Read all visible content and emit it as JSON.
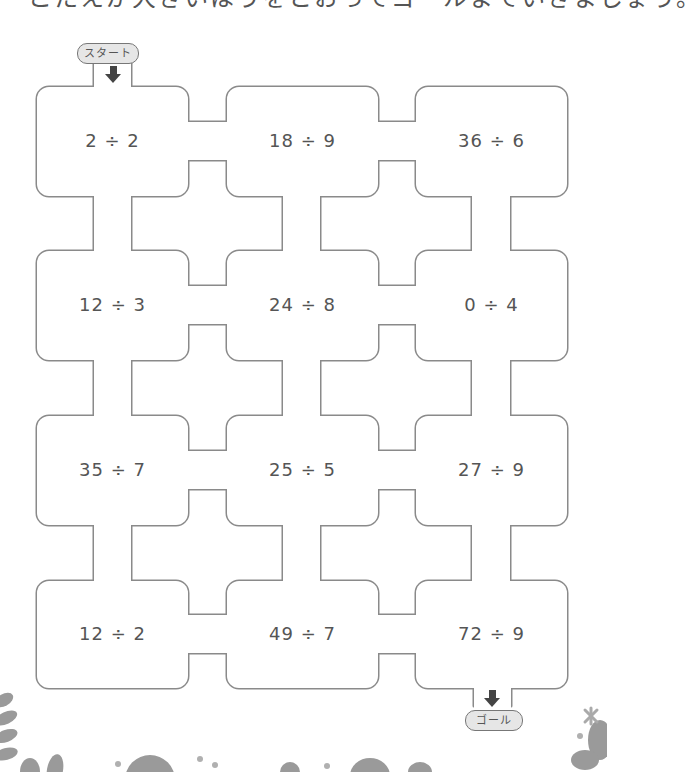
{
  "header": {
    "instruction_partial": "こたえが大きいほうをとおってゴールまでいきましょう。"
  },
  "maze": {
    "start_label": "スタート",
    "goal_label": "ゴール",
    "wall_color": "#8a8a8a",
    "rooms": [
      [
        {
          "problem": "2 ÷ 2"
        },
        {
          "problem": "18 ÷ 9"
        },
        {
          "problem": "36 ÷ 6"
        }
      ],
      [
        {
          "problem": "12 ÷ 3"
        },
        {
          "problem": "24 ÷ 8"
        },
        {
          "problem": "0 ÷ 4"
        }
      ],
      [
        {
          "problem": "35 ÷ 7"
        },
        {
          "problem": "25 ÷ 5"
        },
        {
          "problem": "27 ÷ 9"
        }
      ],
      [
        {
          "problem": "12 ÷ 2"
        },
        {
          "problem": "49 ÷ 7"
        },
        {
          "problem": "72 ÷ 9"
        }
      ]
    ]
  },
  "decorations": {
    "icons": [
      "leaf-icon",
      "flower-icon",
      "dot-icon"
    ]
  }
}
